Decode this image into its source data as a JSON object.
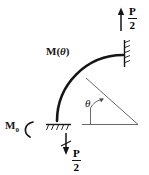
{
  "figure": {
    "labels": {
      "moment_function": "M(",
      "moment_function_var": "θ",
      "moment_function_close": ")",
      "base_moment": "M",
      "base_moment_sub": "0",
      "angle": "θ"
    },
    "forces": [
      {
        "name": "top-force",
        "numerator": "P",
        "denominator": "2",
        "direction": "up"
      },
      {
        "name": "bottom-force",
        "numerator": "P",
        "denominator": "2",
        "direction": "down"
      }
    ],
    "colors": {
      "ink": "#151515",
      "thin": "#555555",
      "background": "#ffffff"
    }
  }
}
